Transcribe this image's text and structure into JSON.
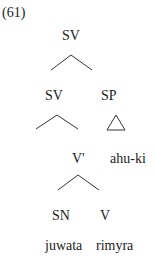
{
  "example_number": "(61)",
  "tree": {
    "root": "SV",
    "left_sv": "SV",
    "sp": "SP",
    "v_bar": "V'",
    "sp_word": "ahu-ki",
    "sn": "SN",
    "v": "V",
    "sn_word": "juwata",
    "v_word": "rimyra"
  }
}
